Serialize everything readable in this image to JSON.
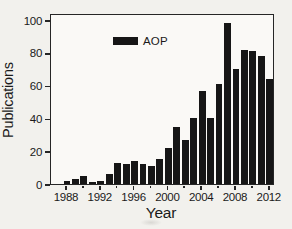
{
  "figure": {
    "background": "#f2f1ed",
    "ink": "#1a1a1a",
    "bar_color": "#161616"
  },
  "chart_data": {
    "type": "bar",
    "title": "",
    "xlabel": "Year",
    "ylabel": "Publications",
    "grid": false,
    "legend_position": "top-left-inside",
    "legend": [
      {
        "label": "AOP",
        "color": "#161616"
      }
    ],
    "ylim": [
      0,
      100
    ],
    "yticks": [
      0,
      20,
      40,
      60,
      80,
      100
    ],
    "xtick_major_labels": [
      "1988",
      "1992",
      "1996",
      "2000",
      "2004",
      "2008",
      "2012"
    ],
    "xtick_minor_years": [
      1990,
      1994,
      1998,
      2002,
      2006,
      2010
    ],
    "categories": [
      1988,
      1989,
      1990,
      1991,
      1992,
      1993,
      1994,
      1995,
      1996,
      1997,
      1998,
      1999,
      2000,
      2001,
      2002,
      2003,
      2004,
      2005,
      2006,
      2007,
      2008,
      2009,
      2010,
      2011,
      2012
    ],
    "series": [
      {
        "name": "AOP",
        "color": "#161616",
        "values": [
          2,
          3,
          5,
          1,
          2,
          6,
          13,
          12,
          14,
          12,
          11,
          15,
          22,
          35,
          27,
          40,
          57,
          40,
          61,
          98,
          70,
          82,
          81,
          78,
          64
        ]
      }
    ]
  }
}
